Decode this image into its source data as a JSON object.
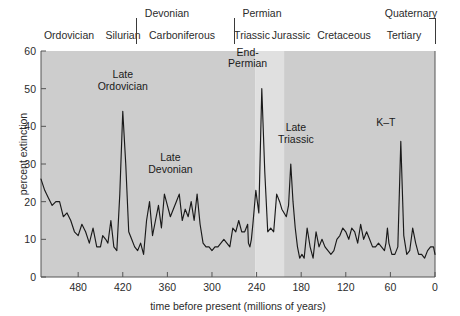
{
  "figure": {
    "width": 460,
    "height": 316,
    "background": "#ffffff",
    "plot_bg_dark": "#cdcdcd",
    "plot_bg_light": "#e0e0e0",
    "line_color": "#1a1a1a",
    "frame_color": "#555555"
  },
  "chart_data": {
    "type": "line",
    "title": "",
    "subtitle": "",
    "xlabel": "time before present (millions of years)",
    "ylabel": "percent extinction",
    "xlim": [
      530,
      0
    ],
    "ylim": [
      0,
      60
    ],
    "x_ticks": [
      480,
      420,
      360,
      300,
      240,
      180,
      120,
      60,
      0
    ],
    "y_ticks": [
      0,
      10,
      20,
      30,
      40,
      50,
      60
    ],
    "x_tick_labels": [
      "480",
      "420",
      "360",
      "300",
      "240",
      "180",
      "120",
      "60",
      "0"
    ],
    "y_tick_labels": [
      "0",
      "10",
      "20",
      "30",
      "40",
      "50",
      "60"
    ],
    "grid": false,
    "legend": "none",
    "x_axis_direction": "reversed",
    "series": [
      {
        "name": "percent extinction",
        "x": [
          530,
          525,
          520,
          515,
          510,
          505,
          500,
          495,
          490,
          485,
          480,
          475,
          470,
          465,
          460,
          455,
          450,
          447,
          443,
          440,
          436,
          432,
          428,
          424,
          420,
          416,
          412,
          408,
          404,
          400,
          396,
          392,
          388,
          384,
          380,
          376,
          372,
          368,
          364,
          360,
          356,
          352,
          348,
          344,
          340,
          336,
          332,
          328,
          324,
          320,
          316,
          312,
          308,
          304,
          300,
          296,
          292,
          288,
          284,
          280,
          276,
          272,
          268,
          264,
          260,
          256,
          252,
          251,
          249,
          247,
          245,
          241,
          237,
          233,
          229,
          225,
          221,
          217,
          213,
          209,
          206,
          203,
          200,
          197,
          194,
          191,
          188,
          185,
          182,
          179,
          176,
          172,
          168,
          164,
          160,
          156,
          152,
          148,
          144,
          140,
          136,
          132,
          128,
          124,
          120,
          116,
          112,
          108,
          104,
          100,
          96,
          92,
          88,
          84,
          80,
          76,
          72,
          68,
          66,
          64,
          62,
          58,
          54,
          50,
          46,
          42,
          38,
          34,
          30,
          26,
          22,
          18,
          14,
          10,
          6,
          2,
          0
        ],
        "y": [
          26,
          23,
          21,
          19,
          20,
          20,
          16,
          17,
          15,
          12,
          11,
          14,
          12,
          9,
          13,
          8,
          8,
          11,
          10,
          9,
          15,
          8,
          7,
          22,
          44,
          30,
          12,
          10,
          8,
          7,
          9,
          6,
          15,
          20,
          11,
          15,
          19,
          13,
          22,
          19,
          16,
          18,
          20,
          22,
          15,
          18,
          16,
          20,
          15,
          22,
          14,
          9,
          8,
          8,
          7,
          8,
          8,
          9,
          10,
          9,
          8,
          13,
          12,
          15,
          12,
          12,
          14,
          9,
          8,
          10,
          14,
          23,
          17,
          50,
          28,
          12,
          13,
          12,
          22,
          20,
          18,
          17,
          16,
          19,
          30,
          20,
          13,
          8,
          5,
          6,
          5,
          13,
          8,
          5,
          12,
          8,
          10,
          8,
          7,
          6,
          7,
          10,
          11,
          13,
          12,
          10,
          13,
          12,
          9,
          14,
          10,
          12,
          10,
          8,
          8,
          9,
          8,
          7,
          9,
          13,
          9,
          6,
          6,
          8,
          36,
          11,
          6,
          7,
          13,
          9,
          6,
          6,
          5,
          7,
          8,
          8,
          6
        ]
      }
    ],
    "annotations": [
      {
        "label": "Late\nOrdovician",
        "x": 420,
        "y": 44,
        "name": "late-ordovician"
      },
      {
        "label": "Late\nDevonian",
        "x": 364,
        "y": 22,
        "name": "late-devonian"
      },
      {
        "label": "End-\nPermian",
        "x": 252,
        "y": 50,
        "name": "end-permian"
      },
      {
        "label": "Late\nTriassic",
        "x": 206,
        "y": 30,
        "name": "late-triassic"
      },
      {
        "label": "K–T",
        "x": 66,
        "y": 36,
        "name": "k-t"
      }
    ],
    "shaded_bands": [
      {
        "name": "early-band",
        "from": 530,
        "to": 242,
        "shade": "#cdcdcd"
      },
      {
        "name": "triassic-jurassic-band",
        "from": 242,
        "to": 203,
        "shade": "#e0e0e0"
      },
      {
        "name": "late-band",
        "from": 203,
        "to": 0,
        "shade": "#cdcdcd"
      }
    ]
  },
  "period_header": {
    "top_row": [
      {
        "label": "Devonian",
        "center_x": 167,
        "name": "period-devonian"
      },
      {
        "label": "Permian",
        "center_x": 262,
        "name": "period-permian"
      },
      {
        "label": "Quaternary",
        "center_x": 411,
        "name": "period-quaternary"
      }
    ],
    "bottom_row": [
      {
        "label": "Ordovician",
        "center_x": 69,
        "name": "period-ordovician"
      },
      {
        "label": "Silurian",
        "center_x": 123,
        "name": "period-silurian"
      },
      {
        "label": "Carboniferous",
        "center_x": 182,
        "name": "period-carboniferous"
      },
      {
        "label": "Triassic",
        "center_x": 252,
        "name": "period-triassic"
      },
      {
        "label": "Jurassic",
        "center_x": 291,
        "name": "period-jurassic"
      },
      {
        "label": "Cretaceous",
        "center_x": 344,
        "name": "period-cretaceous"
      },
      {
        "label": "Tertiary",
        "center_x": 404,
        "name": "period-tertiary"
      }
    ],
    "separators": [
      {
        "x": 136,
        "top": 18,
        "bottom": 44,
        "name": "separator-devonian"
      },
      {
        "x": 234,
        "top": 18,
        "bottom": 44,
        "name": "separator-permian"
      },
      {
        "x": 435,
        "top": 18,
        "bottom": 44,
        "name": "separator-quaternary"
      }
    ],
    "quaternary_bracket": {
      "x": 435,
      "y": 18,
      "width": 6,
      "name": "quaternary-bracket"
    }
  }
}
